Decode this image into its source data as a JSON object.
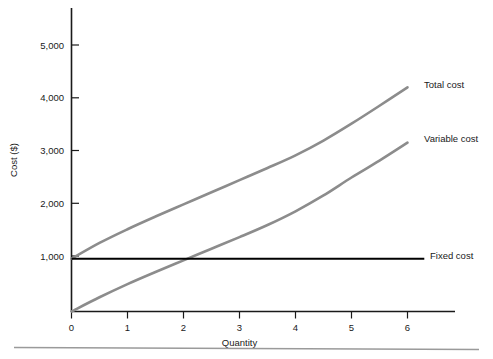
{
  "chart_data": {
    "type": "line",
    "title": "",
    "subtitle": "",
    "xlabel": "Quantity",
    "ylabel": "Cost ($)",
    "xlim": [
      0,
      6.9
    ],
    "ylim": [
      0,
      5600
    ],
    "xticks": [
      0,
      1,
      2,
      3,
      4,
      5,
      6
    ],
    "xticklabels": [
      "0",
      "1",
      "2",
      "3",
      "4",
      "5",
      "6"
    ],
    "yticks": [
      1000,
      2000,
      3000,
      4000,
      5000
    ],
    "yticklabels": [
      "1,000",
      "2,000",
      "3,000",
      "4,000",
      "5,000"
    ],
    "grid": false,
    "legend_position": "right-inline-labels",
    "x": [
      0,
      0.5,
      1,
      1.5,
      2,
      2.5,
      3,
      3.5,
      4,
      4.5,
      5,
      5.5,
      6
    ],
    "series": [
      {
        "name": "Total cost",
        "label": "Total cost",
        "color": "#8c8c8c",
        "values": [
          1000,
          1300,
          1560,
          1800,
          2030,
          2260,
          2490,
          2720,
          2960,
          3240,
          3560,
          3900,
          4250
        ],
        "label_x": 6.0,
        "label_y": 4250
      },
      {
        "name": "Variable cost",
        "label": "Variable cost",
        "color": "#8c8c8c",
        "values": [
          0,
          270,
          520,
          750,
          970,
          1190,
          1410,
          1640,
          1900,
          2200,
          2540,
          2860,
          3200
        ],
        "label_x": 6.0,
        "label_y": 3200
      },
      {
        "name": "Fixed cost",
        "label": "Fixed cost",
        "color": "#000000",
        "values": [
          1000,
          1000,
          1000,
          1000,
          1000,
          1000,
          1000,
          1000,
          1000,
          1000,
          1000,
          1000,
          1000
        ],
        "label_x": 6.3,
        "label_y": 1000
      }
    ],
    "annotations": [
      {
        "text": "Total cost",
        "series": "Total cost"
      },
      {
        "text": "Variable cost",
        "series": "Variable cost"
      },
      {
        "text": "Fixed cost",
        "series": "Fixed cost"
      }
    ],
    "colors": {
      "axis": "#1a1a1a",
      "gray_series": "#8c8c8c",
      "fixed_series": "#000000",
      "footer_rule": "#9a9a9a",
      "background": "#ffffff"
    }
  },
  "labels": {
    "y_title": "Cost ($)",
    "x_title": "Quantity",
    "y_ticks": [
      "5,000",
      "4,000",
      "3,000",
      "2,000",
      "1,000"
    ],
    "x_ticks": [
      "0",
      "1",
      "2",
      "3",
      "4",
      "5",
      "6"
    ],
    "series_total": "Total cost",
    "series_variable": "Variable cost",
    "series_fixed": "Fixed cost"
  }
}
